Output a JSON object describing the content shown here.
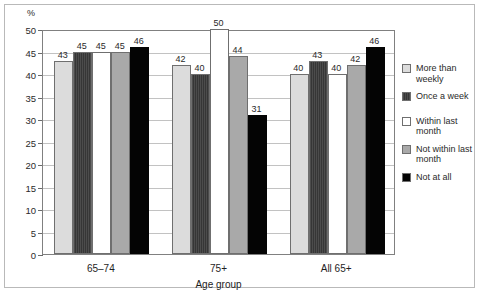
{
  "chart_data": {
    "type": "bar",
    "title": "",
    "xlabel": "Age group",
    "ylabel": "%",
    "ylim": [
      0,
      50
    ],
    "yticks": [
      0,
      5,
      10,
      15,
      20,
      25,
      30,
      35,
      40,
      45,
      50
    ],
    "grid": true,
    "legend_position": "right",
    "categories": [
      "65–74",
      "75+",
      "All 65+"
    ],
    "series": [
      {
        "name": "More than weekly",
        "values": [
          43,
          42,
          40
        ],
        "color": "#dcdcdc"
      },
      {
        "name": "Once a week",
        "values": [
          45,
          40,
          43
        ],
        "color": "#3f3f3f"
      },
      {
        "name": "Within last month",
        "values": [
          45,
          50,
          40
        ],
        "color": "#ffffff"
      },
      {
        "name": "Not within last month",
        "values": [
          45,
          44,
          42
        ],
        "color": "#a9a9a9"
      },
      {
        "name": "Not at all",
        "values": [
          46,
          31,
          46
        ],
        "color": "#040404"
      }
    ]
  },
  "axis": {
    "y_unit_label": "%",
    "tick_labels": [
      "50",
      "45",
      "40",
      "35",
      "30",
      "25",
      "20",
      "15",
      "10",
      "5",
      "0"
    ],
    "x_title": "Age group",
    "x_labels": [
      "65–74",
      "75+",
      "All 65+"
    ]
  },
  "legend": {
    "items": [
      {
        "label": "More than weekly",
        "swatch": "swatch-more-than-weekly"
      },
      {
        "label": "Once a week",
        "swatch": "swatch-once-a-week"
      },
      {
        "label": "Within last month",
        "swatch": "swatch-within-last-month"
      },
      {
        "label": "Not within last month",
        "swatch": "swatch-not-within-last-month"
      },
      {
        "label": "Not at all",
        "swatch": "swatch-not-at-all"
      }
    ]
  },
  "values_flat": {
    "g0": [
      "43",
      "45",
      "45",
      "45",
      "46"
    ],
    "g1": [
      "42",
      "40",
      "50",
      "44",
      "31"
    ],
    "g2": [
      "40",
      "43",
      "40",
      "42",
      "46"
    ]
  }
}
